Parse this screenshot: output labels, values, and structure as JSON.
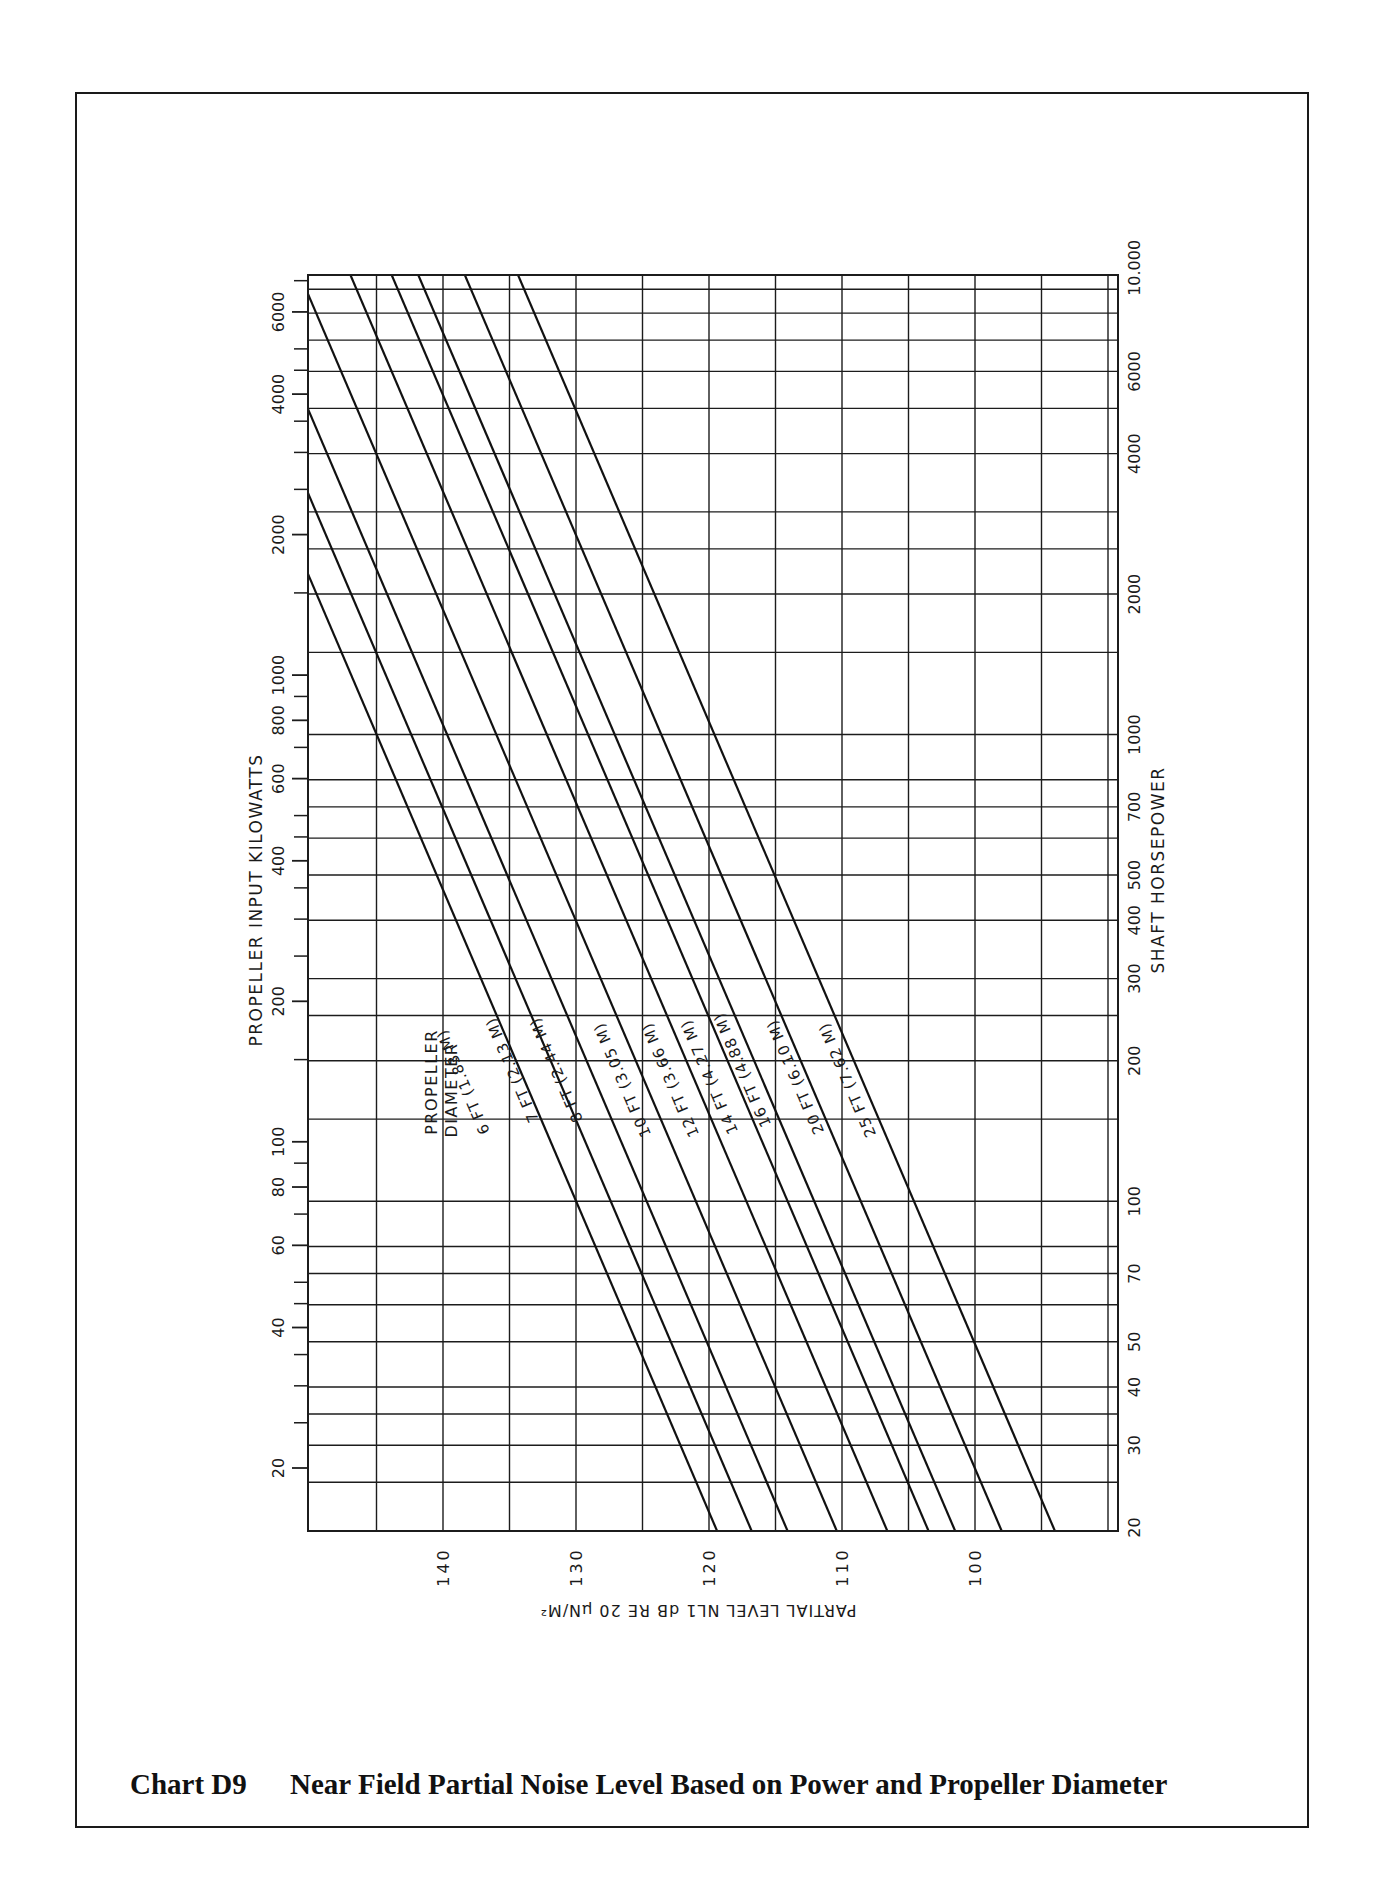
{
  "caption": {
    "chart_number": "Chart D9",
    "title": "Near Field Partial Noise Level Based on Power and Propeller Diameter"
  },
  "axes": {
    "left_label": "PROPELLER INPUT KILOWATTS",
    "right_label": "SHAFT HORSEPOWER",
    "bottom_label": "PARTIAL LEVEL NL1 dB RE 20 µN/M²",
    "legend_label_line1": "PROPELLER",
    "legend_label_line2": "DIAMETER"
  },
  "chart_data": {
    "type": "line",
    "title": "Near Field Partial Noise Level Based on Power and Propeller Diameter",
    "xlabel": "PARTIAL LEVEL NL1 dB RE 20 µN/M²",
    "ylabel": "PROPELLER INPUT KILOWATTS",
    "ylabel_right": "SHAFT HORSEPOWER",
    "x_reversed": true,
    "xlim": [
      150,
      89
    ],
    "ylim_kw": [
      14.6,
      7500
    ],
    "yscale": "log",
    "grid": true,
    "x_ticks": [
      140,
      130,
      120,
      110,
      100
    ],
    "y_ticks_left_kw": [
      20,
      40,
      60,
      80,
      100,
      200,
      400,
      600,
      800,
      1000,
      2000,
      4000,
      6000
    ],
    "y_ticks_right_hp": [
      "20",
      "30",
      "40",
      "50",
      "70",
      "100",
      "200",
      "300",
      "400",
      "500",
      "700",
      "1000",
      "2000",
      "4000",
      "6000",
      "10.000"
    ],
    "slope_db_per_decade": 15,
    "series": [
      {
        "name": "6 FT (1.83 M)",
        "db_at_100kw": 131.9,
        "points": [
          {
            "kw": 14.6,
            "db": 119.4
          },
          {
            "kw": 1460,
            "db": 149.4
          }
        ]
      },
      {
        "name": "7 FT (2.13 M)",
        "db_at_100kw": 129.3,
        "points": [
          {
            "kw": 14.6,
            "db": 116.8
          },
          {
            "kw": 2200,
            "db": 149.5
          }
        ]
      },
      {
        "name": "8 FT (2.44 M)",
        "db_at_100kw": 126.6,
        "points": [
          {
            "kw": 14.6,
            "db": 114.1
          },
          {
            "kw": 3300,
            "db": 149.4
          }
        ]
      },
      {
        "name": "10 FT (3.05 M)",
        "db_at_100kw": 122.9,
        "points": [
          {
            "kw": 14.6,
            "db": 110.4
          },
          {
            "kw": 5500,
            "db": 149.0
          }
        ]
      },
      {
        "name": "12 FT (3.66 M)",
        "db_at_100kw": 119.1,
        "points": [
          {
            "kw": 14.6,
            "db": 106.6
          },
          {
            "kw": 7500,
            "db": 147.2
          }
        ]
      },
      {
        "name": "14 FT (4.27 M)",
        "db_at_100kw": 116.0,
        "points": [
          {
            "kw": 14.6,
            "db": 103.5
          },
          {
            "kw": 7500,
            "db": 144.1
          }
        ]
      },
      {
        "name": "16 FT (4.88 M)",
        "db_at_100kw": 114.0,
        "points": [
          {
            "kw": 14.6,
            "db": 101.5
          },
          {
            "kw": 7500,
            "db": 142.1
          }
        ]
      },
      {
        "name": "20 FT (6.10 M)",
        "db_at_100kw": 110.5,
        "points": [
          {
            "kw": 14.6,
            "db": 98.0
          },
          {
            "kw": 7500,
            "db": 138.6
          }
        ]
      },
      {
        "name": "25 FT (7.62 M)",
        "db_at_100kw": 106.5,
        "points": [
          {
            "kw": 14.6,
            "db": 94.0
          },
          {
            "kw": 7500,
            "db": 134.6
          }
        ]
      }
    ]
  },
  "labels": {
    "series": [
      {
        "text": "6 FT (1.83 M)",
        "x": 468,
        "y": 1080
      },
      {
        "text": "7 FT (2.13 M)",
        "x": 517,
        "y": 1068
      },
      {
        "text": "8 FT (2.44 M)",
        "x": 561,
        "y": 1068
      },
      {
        "text": "10 FT (3.05 M)",
        "x": 627,
        "y": 1078
      },
      {
        "text": "12 FT (3.66 M)",
        "x": 675,
        "y": 1078
      },
      {
        "text": "14 FT (4.27 M)",
        "x": 714,
        "y": 1075
      },
      {
        "text": "16 FT (4.88 M)",
        "x": 747,
        "y": 1068
      },
      {
        "text": "20 FT (6.10 M)",
        "x": 800,
        "y": 1075
      },
      {
        "text": "25 FT (7.62 M)",
        "x": 852,
        "y": 1078
      }
    ]
  }
}
